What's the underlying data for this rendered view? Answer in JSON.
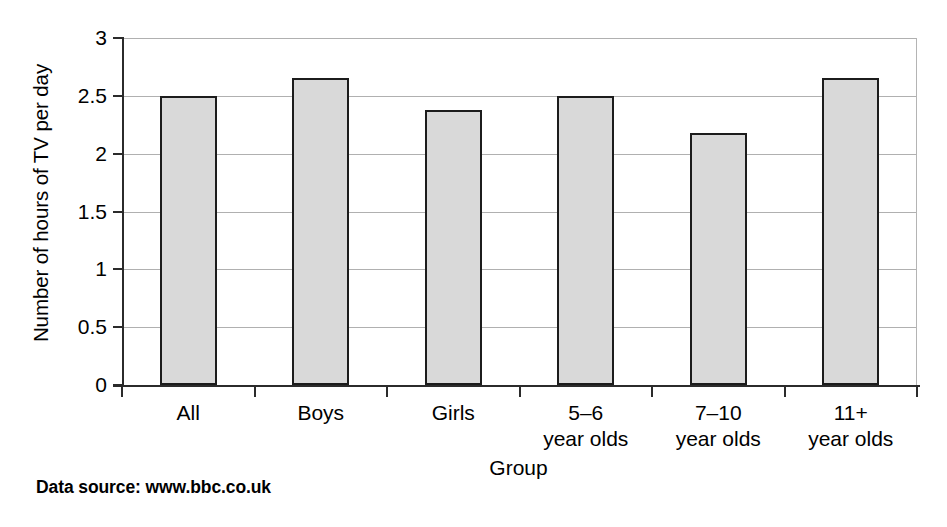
{
  "figure": {
    "y_axis_title": "Number of hours of TV per day",
    "x_axis_title": "Group",
    "source_note": "Data source: www.bbc.co.uk"
  },
  "chart_data": {
    "type": "bar",
    "title": "",
    "subtitle": "",
    "xlabel": "Group",
    "ylabel": "Number of hours of TV per day",
    "categories": [
      "All",
      "Boys",
      "Girls",
      "5–6 year olds",
      "7–10 year olds",
      "11+ year olds"
    ],
    "category_lines": [
      {
        "line1": "All",
        "line2": ""
      },
      {
        "line1": "Boys",
        "line2": ""
      },
      {
        "line1": "Girls",
        "line2": ""
      },
      {
        "line1": "5–6",
        "line2": "year olds"
      },
      {
        "line1": "7–10",
        "line2": "year olds"
      },
      {
        "line1": "11+",
        "line2": "year olds"
      }
    ],
    "values": [
      2.5,
      2.65,
      2.38,
      2.5,
      2.18,
      2.65
    ],
    "ylim": [
      0,
      3
    ],
    "ytick_values": [
      0,
      0.5,
      1,
      1.5,
      2,
      2.5,
      3
    ],
    "ytick_labels": [
      "0",
      "0.5",
      "1",
      "1.5",
      "2",
      "2.5",
      "3"
    ],
    "grid": true,
    "grid_axis": "y",
    "legend": false,
    "legend_position": "none",
    "bar_fill_color": "#d9d9d9",
    "bar_edge_color": "#1c1c1c",
    "gridline_color": "#b0b0b0",
    "axis_color": "#2b2b2b"
  }
}
